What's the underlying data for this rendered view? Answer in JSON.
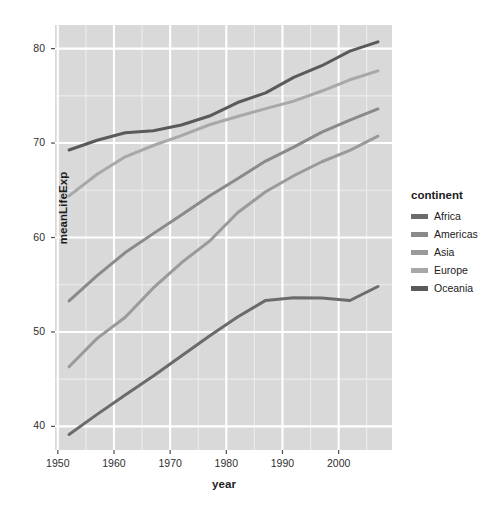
{
  "chart_data": {
    "type": "line",
    "title": "",
    "xlabel": "year",
    "ylabel": "meanLifeExp",
    "xlim": [
      1950.2,
      1908.8
    ],
    "x_ticks": [
      1950,
      1960,
      1970,
      1980,
      1990,
      2000
    ],
    "y_ticks": [
      40,
      50,
      60,
      70,
      80
    ],
    "ylim": [
      37.5,
      82.5
    ],
    "x_range": [
      1949.5,
      2009.5
    ],
    "grid": true,
    "legend_position": "right",
    "legend_title": "continent",
    "x": [
      1952,
      1957,
      1962,
      1967,
      1972,
      1977,
      1982,
      1987,
      1992,
      1997,
      2002,
      2007
    ],
    "series": [
      {
        "name": "Africa",
        "color": "#6b6b6b",
        "values": [
          39.14,
          41.27,
          43.32,
          45.33,
          47.45,
          49.58,
          51.59,
          53.34,
          53.63,
          53.6,
          53.33,
          54.81
        ]
      },
      {
        "name": "Americas",
        "color": "#8a8a8a",
        "values": [
          53.28,
          55.96,
          58.4,
          60.41,
          62.39,
          64.39,
          66.23,
          68.09,
          69.57,
          71.15,
          72.42,
          73.61
        ]
      },
      {
        "name": "Asia",
        "color": "#9a9a9a",
        "values": [
          46.31,
          49.32,
          51.56,
          54.66,
          57.32,
          59.61,
          62.62,
          64.85,
          66.54,
          68.02,
          69.23,
          70.73
        ]
      },
      {
        "name": "Europe",
        "color": "#a8a8a8",
        "values": [
          64.41,
          66.7,
          68.54,
          69.74,
          70.78,
          71.94,
          72.81,
          73.64,
          74.44,
          75.51,
          76.7,
          77.65
        ]
      },
      {
        "name": "Oceania",
        "color": "#5a5a5a",
        "values": [
          69.26,
          70.3,
          71.09,
          71.31,
          71.91,
          72.86,
          74.29,
          75.32,
          76.95,
          78.19,
          79.74,
          80.72
        ]
      }
    ]
  },
  "axes": {
    "y_title": "meanLifeExp",
    "x_title": "year",
    "y_tick_labels": [
      "80",
      "70",
      "60",
      "50",
      "40"
    ],
    "x_tick_labels": [
      "1950",
      "1960",
      "1970",
      "1980",
      "1990",
      "2000"
    ]
  },
  "legend": {
    "title": "continent",
    "items": [
      {
        "label": "Africa",
        "color": "#6b6b6b"
      },
      {
        "label": "Americas",
        "color": "#8a8a8a"
      },
      {
        "label": "Asia",
        "color": "#9a9a9a"
      },
      {
        "label": "Europe",
        "color": "#a8a8a8"
      },
      {
        "label": "Oceania",
        "color": "#5a5a5a"
      }
    ]
  },
  "style": {
    "panel_background": "#d9d9d9",
    "gridline_major": "#ffffff",
    "gridline_minor": "#ececec",
    "figure_background": "#ffffff",
    "tick_color": "#4d4d4d"
  }
}
